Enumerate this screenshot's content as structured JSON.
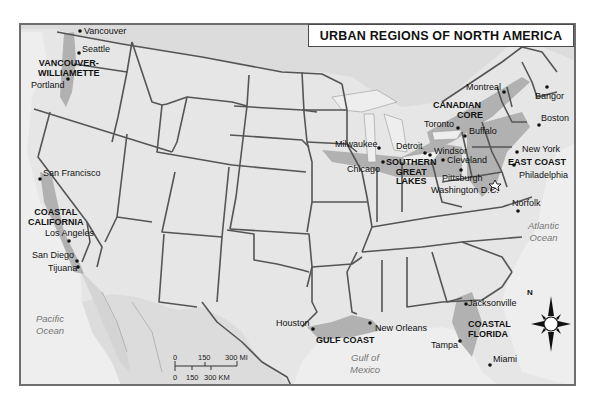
{
  "title": "URBAN REGIONS OF NORTH AMERICA",
  "colors": {
    "land_usa": "#e6e6e6",
    "land_other": "#dcdcdc",
    "water": "#eeeeee",
    "urban_region": "#a8a8a8",
    "state_border": "#555555",
    "frame": "#6e6e6e"
  },
  "cities": [
    {
      "name": "Vancouver"
    },
    {
      "name": "Seattle"
    },
    {
      "name": "Portland"
    },
    {
      "name": "San Francisco"
    },
    {
      "name": "Los Angeles"
    },
    {
      "name": "San Diego"
    },
    {
      "name": "Tijuana"
    },
    {
      "name": "Montreal"
    },
    {
      "name": "Bangor"
    },
    {
      "name": "Toronto"
    },
    {
      "name": "Buffalo"
    },
    {
      "name": "Boston"
    },
    {
      "name": "Milwaukee"
    },
    {
      "name": "Detroit"
    },
    {
      "name": "Windsor"
    },
    {
      "name": "Chicago"
    },
    {
      "name": "Cleveland"
    },
    {
      "name": "New York"
    },
    {
      "name": "Pittsburgh"
    },
    {
      "name": "Philadelphia"
    },
    {
      "name": "Washington D.C."
    },
    {
      "name": "Norfolk"
    },
    {
      "name": "Houston"
    },
    {
      "name": "New Orleans"
    },
    {
      "name": "Jacksonville"
    },
    {
      "name": "Tampa"
    },
    {
      "name": "Miami"
    }
  ],
  "regions": [
    {
      "name": "VANCOUVER-\nWILLIAMETTE",
      "line1": "VANCOUVER-",
      "line2": "WILLIAMETTE"
    },
    {
      "name": "COASTAL CALIFORNIA",
      "line1": "COASTAL",
      "line2": "CALIFORNIA"
    },
    {
      "name": "CANADIAN CORE",
      "line1": "CANADIAN",
      "line2": "CORE"
    },
    {
      "name": "SOUTHERN GREAT LAKES",
      "line1": "SOUTHERN",
      "line2": "GREAT",
      "line3": "LAKES"
    },
    {
      "name": "EAST COAST",
      "line1": "EAST COAST"
    },
    {
      "name": "GULF COAST",
      "line1": "GULF COAST"
    },
    {
      "name": "COASTAL FLORIDA",
      "line1": "COASTAL",
      "line2": "FLORIDA"
    }
  ],
  "water_bodies": [
    {
      "line1": "Pacific",
      "line2": "Ocean"
    },
    {
      "line1": "Atlantic",
      "line2": "Ocean"
    },
    {
      "line1": "Gulf of",
      "line2": "Mexico"
    }
  ],
  "scale_bar": {
    "miles": [
      "0",
      "150",
      "300 MI"
    ],
    "km": [
      "0",
      "150",
      "300 KM"
    ]
  },
  "compass": {
    "north_label": "N"
  }
}
